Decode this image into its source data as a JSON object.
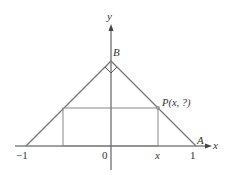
{
  "diagram": {
    "axes": {
      "x_label": "x",
      "y_label": "y"
    },
    "tick_labels": {
      "minus_one": "−1",
      "zero": "0",
      "x": "x",
      "one": "1"
    },
    "points": {
      "B": "B",
      "A": "A",
      "P": "P(x, ?)"
    },
    "colors": {
      "axis": "#444444",
      "triangle": "#777777",
      "rectangle": "#888888",
      "point": "#999999",
      "text": "#333333"
    }
  }
}
